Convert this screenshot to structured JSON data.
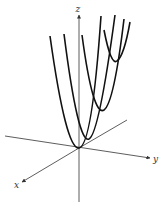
{
  "diagram": {
    "axes": {
      "x": {
        "label": "x"
      },
      "y": {
        "label": "y"
      },
      "z": {
        "label": "z"
      }
    },
    "colors": {
      "curve": "#111111",
      "axis": "#333333",
      "background": "#ffffff"
    },
    "curves": [
      {
        "name": "parabola-1",
        "vertex": [
          79,
          148
        ],
        "left_top": [
          50,
          36
        ],
        "right_top": [
          101,
          16
        ]
      },
      {
        "name": "parabola-2",
        "vertex": [
          89,
          139
        ],
        "left_top": [
          64,
          34
        ],
        "right_top": [
          115,
          15
        ]
      },
      {
        "name": "parabola-3",
        "vertex": [
          104,
          110
        ],
        "left_top": [
          82,
          35
        ],
        "right_top": [
          124,
          19
        ]
      },
      {
        "name": "parabola-4",
        "vertex": [
          117,
          61
        ],
        "left_top": [
          104,
          30
        ],
        "right_top": [
          130,
          22
        ]
      }
    ]
  }
}
